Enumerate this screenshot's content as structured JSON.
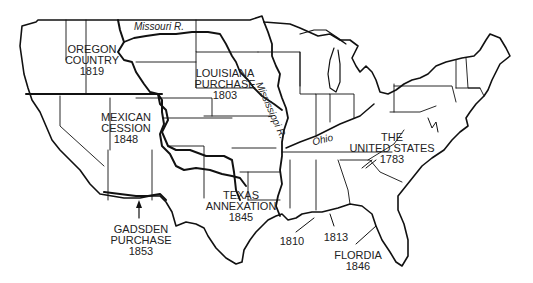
{
  "map": {
    "subject": "United States territorial acquisitions",
    "colors": {
      "background": "#ffffff",
      "lines": "#111111",
      "text": "#222222"
    },
    "regions": [
      {
        "id": "oregon",
        "name_lines": [
          "OREGON",
          "COUNTRY"
        ],
        "year": "1819"
      },
      {
        "id": "louisiana",
        "name_lines": [
          "LOUISIANA",
          "PURCHASE"
        ],
        "year": "1803"
      },
      {
        "id": "mexican",
        "name_lines": [
          "MEXICAN",
          "CESSION"
        ],
        "year": "1848"
      },
      {
        "id": "texas",
        "name_lines": [
          "TEXAS",
          "ANNEXATION"
        ],
        "year": "1845"
      },
      {
        "id": "gadsden",
        "name_lines": [
          "GADSDEN",
          "PURCHASE"
        ],
        "year": "1853"
      },
      {
        "id": "united_states",
        "name_lines": [
          "THE",
          "UNITED STATES"
        ],
        "year": "1783"
      },
      {
        "id": "florida",
        "name_lines": [
          "FLORDIA"
        ],
        "year": "1846"
      },
      {
        "id": "west_florida_1810",
        "name_lines": [],
        "year": "1810"
      },
      {
        "id": "west_florida_1813",
        "name_lines": [],
        "year": "1813"
      }
    ],
    "rivers": [
      {
        "id": "missouri",
        "label": "Missouri R."
      },
      {
        "id": "mississippi",
        "label": "Mississippi R."
      },
      {
        "id": "ohio",
        "label": "Ohio"
      }
    ]
  }
}
